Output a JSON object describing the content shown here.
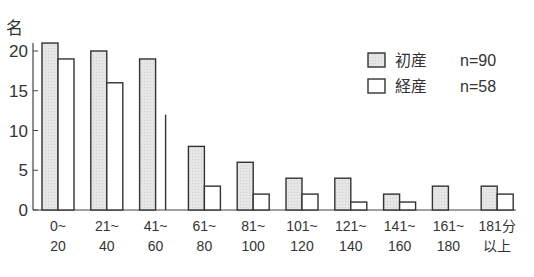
{
  "chart_data": {
    "type": "bar",
    "title": "",
    "xlabel": "",
    "ylabel": "名",
    "ylim": [
      0,
      20
    ],
    "yticks": [
      0,
      5,
      10,
      15,
      20
    ],
    "grid": false,
    "legend_position": "upper right",
    "categories": [
      "0~20",
      "21~40",
      "41~60",
      "61~80",
      "81~100",
      "101~120",
      "121~140",
      "141~160",
      "161~180",
      "181分以上"
    ],
    "category_labels": [
      [
        "0~",
        "20"
      ],
      [
        "21~",
        "40"
      ],
      [
        "41~",
        "60"
      ],
      [
        "61~",
        "80"
      ],
      [
        "81~",
        "100"
      ],
      [
        "101~",
        "120"
      ],
      [
        "121~",
        "140"
      ],
      [
        "141~",
        "160"
      ],
      [
        "161~",
        "180"
      ],
      [
        "181分",
        "以上"
      ]
    ],
    "series": [
      {
        "name": "初産",
        "n_label": "n=90",
        "fill": "#e4e4e4",
        "values": [
          21,
          20,
          19,
          8,
          6,
          4,
          4,
          2,
          3,
          3
        ]
      },
      {
        "name": "経産",
        "n_label": "n=58",
        "fill": "#ffffff",
        "values": [
          19,
          16,
          12,
          3,
          2,
          2,
          1,
          1,
          0,
          2
        ]
      }
    ],
    "annotations": [
      "41~60 経産 bar drawn only as a partial thin line reaching ~12"
    ]
  },
  "legend": {
    "items": [
      {
        "label": "初産",
        "n": "n=90"
      },
      {
        "label": "経産",
        "n": "n=58"
      }
    ]
  },
  "axis": {
    "unit_label": "名"
  }
}
